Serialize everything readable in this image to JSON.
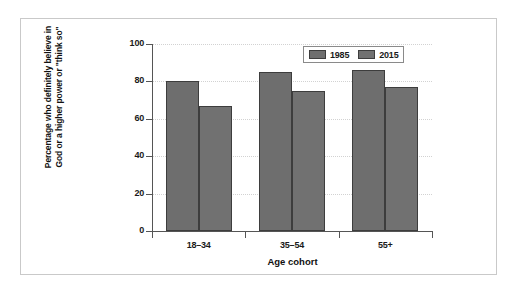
{
  "chart_data": {
    "type": "bar",
    "title": "",
    "subtitle": "",
    "xlabel": "Age cohort",
    "ylabel": "Percentage who definitely believe in God or a higher power or \"think so\"",
    "ylabel_line1": "Percentage who definitely believe in",
    "ylabel_line2": "God or a higher power or \"think so\"",
    "categories": [
      "18–34",
      "35–54",
      "55+"
    ],
    "series": [
      {
        "name": "1985",
        "values": [
          80,
          85,
          86
        ],
        "color": "#6e6e6e"
      },
      {
        "name": "2015",
        "values": [
          67,
          75,
          77
        ],
        "color": "#717171"
      }
    ],
    "ylim": [
      0,
      100
    ],
    "yticks": [
      0,
      20,
      40,
      60,
      80,
      100
    ],
    "ytick_labels": [
      "0",
      "20",
      "40",
      "60",
      "80",
      "100"
    ],
    "grid": "horizontal-dotted",
    "legend_position": "top-right",
    "legend_entries": [
      "1985",
      "2015"
    ],
    "bar_outline_color": "#3d3d3d",
    "axis_color": "#555555",
    "frame_color": "#c9c9c9",
    "background": "#ffffff"
  }
}
